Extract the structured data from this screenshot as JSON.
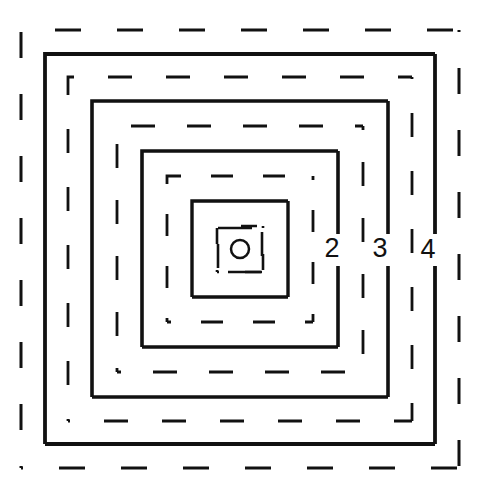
{
  "figure": {
    "width": 482,
    "height": 490,
    "background_color": "#ffffff",
    "stroke_color": "#111111",
    "center": {
      "x": 240,
      "y": 249
    }
  },
  "chart_data": {
    "type": "diagram",
    "xlabel": "",
    "ylabel": "",
    "grid": false,
    "legend": "none",
    "center_marker": {
      "name": "center-circle",
      "shape": "circle",
      "cx": 240,
      "cy": 249,
      "r": 9,
      "style": "open",
      "stroke_width": 2.5
    },
    "rings": [
      {
        "index": 1,
        "label": "",
        "style": "dashed",
        "half_size": 23,
        "x": 217,
        "y": 226,
        "size": 46,
        "stroke_width": 2.6,
        "dash": "16 26",
        "dash_offset": 14
      },
      {
        "index": 2,
        "label": "",
        "style": "solid",
        "half_size": 48,
        "x": 192,
        "y": 201,
        "size": 96,
        "stroke_width": 3.4,
        "dash": "",
        "dash_offset": 0
      },
      {
        "index": 3,
        "label": "",
        "style": "dashed",
        "half_size": 73,
        "x": 167,
        "y": 176,
        "size": 146,
        "stroke_width": 2.8,
        "dash": "22 30",
        "dash_offset": 18
      },
      {
        "index": 4,
        "label": "2",
        "style": "solid",
        "half_size": 98,
        "x": 142,
        "y": 151,
        "size": 196,
        "stroke_width": 3.6,
        "dash": "",
        "dash_offset": 0
      },
      {
        "index": 5,
        "label": "",
        "style": "dashed",
        "half_size": 123,
        "x": 117,
        "y": 126,
        "size": 246,
        "stroke_width": 2.8,
        "dash": "24 32",
        "dash_offset": 20
      },
      {
        "index": 6,
        "label": "3",
        "style": "solid",
        "half_size": 148,
        "x": 92,
        "y": 101,
        "size": 296,
        "stroke_width": 3.6,
        "dash": "",
        "dash_offset": 0
      },
      {
        "index": 7,
        "label": "",
        "style": "dashed",
        "half_size": 172,
        "x": 68,
        "y": 77,
        "size": 344,
        "stroke_width": 2.8,
        "dash": "24 34",
        "dash_offset": 22
      },
      {
        "index": 8,
        "label": "4",
        "style": "solid",
        "half_size": 195,
        "x": 45,
        "y": 54,
        "size": 390,
        "stroke_width": 3.8,
        "dash": "",
        "dash_offset": 0
      },
      {
        "index": 9,
        "label": "",
        "style": "dashed",
        "half_size": 219,
        "x": 21,
        "y": 30,
        "size": 438,
        "stroke_width": 3.0,
        "dash": "26 36",
        "dash_offset": 24
      }
    ],
    "inner_marks": [
      {
        "name": "inner-dash-top",
        "x1": 218,
        "y1": 228,
        "x2": 252,
        "y2": 228
      },
      {
        "name": "inner-dash-right",
        "x1": 262,
        "y1": 232,
        "x2": 262,
        "y2": 256
      },
      {
        "name": "inner-dash-bottom",
        "x1": 228,
        "y1": 272,
        "x2": 262,
        "y2": 272
      },
      {
        "name": "inner-dash-left",
        "x1": 218,
        "y1": 244,
        "x2": 218,
        "y2": 268
      }
    ],
    "labels": [
      {
        "name": "ring-label-2",
        "text": "2",
        "x": 332,
        "y": 250,
        "ring_index": 4
      },
      {
        "name": "ring-label-3",
        "text": "3",
        "x": 380,
        "y": 250,
        "ring_index": 6
      },
      {
        "name": "ring-label-4",
        "text": "4",
        "x": 428,
        "y": 251,
        "ring_index": 8
      }
    ],
    "label_gap": {
      "y_min": 234,
      "y_max": 266
    }
  }
}
